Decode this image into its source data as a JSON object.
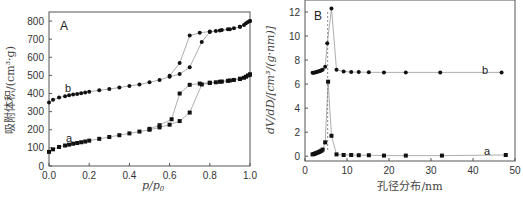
{
  "chart_data": [
    {
      "type": "scatter",
      "panel_label": "A",
      "title": "",
      "xlabel": "p/p0",
      "ylabel": "吸附体积/(cm³·g)",
      "xlim": [
        0,
        1.0
      ],
      "ylim": [
        0,
        850
      ],
      "xticks": [
        "0.0",
        "0.2",
        "0.4",
        "0.6",
        "0.8",
        "1.0"
      ],
      "yticks": [
        "0",
        "100",
        "200",
        "300",
        "400",
        "500",
        "600",
        "700",
        "800"
      ],
      "grid": false,
      "series": [
        {
          "name": "a",
          "marker": "square",
          "adsorption": {
            "x": [
              0.0,
              0.02,
              0.05,
              0.08,
              0.1,
              0.12,
              0.14,
              0.16,
              0.18,
              0.2,
              0.25,
              0.3,
              0.35,
              0.4,
              0.45,
              0.5,
              0.55,
              0.6,
              0.65,
              0.7,
              0.76,
              0.8,
              0.83,
              0.86,
              0.89,
              0.92,
              0.95,
              0.97,
              0.98,
              0.99,
              1.0
            ],
            "y": [
              78,
              92,
              105,
              113,
              118,
              123,
              127,
              131,
              135,
              140,
              150,
              160,
              170,
              180,
              190,
              200,
              213,
              228,
              248,
              295,
              450,
              458,
              462,
              466,
              470,
              475,
              480,
              487,
              493,
              500,
              505
            ]
          },
          "desorption": {
            "x": [
              1.0,
              0.95,
              0.9,
              0.85,
              0.8,
              0.75,
              0.7,
              0.65,
              0.61,
              0.55,
              0.5
            ],
            "y": [
              505,
              482,
              472,
              465,
              460,
              455,
              448,
              400,
              258,
              225,
              205
            ]
          }
        },
        {
          "name": "b",
          "marker": "circle",
          "adsorption": {
            "x": [
              0.0,
              0.02,
              0.05,
              0.08,
              0.1,
              0.12,
              0.14,
              0.16,
              0.18,
              0.2,
              0.25,
              0.3,
              0.35,
              0.4,
              0.45,
              0.5,
              0.55,
              0.6,
              0.65,
              0.7,
              0.76,
              0.8,
              0.83,
              0.86,
              0.89,
              0.92,
              0.95,
              0.97,
              0.98,
              0.99,
              1.0
            ],
            "y": [
              350,
              365,
              378,
              385,
              390,
              395,
              398,
              402,
              405,
              410,
              418,
              425,
              433,
              442,
              450,
              462,
              475,
              492,
              508,
              545,
              685,
              740,
              745,
              750,
              755,
              760,
              768,
              778,
              788,
              795,
              800
            ]
          },
          "desorption": {
            "x": [
              1.0,
              0.95,
              0.9,
              0.85,
              0.8,
              0.75,
              0.7,
              0.65,
              0.6
            ],
            "y": [
              800,
              768,
              755,
              748,
              742,
              735,
              720,
              568,
              498
            ]
          }
        }
      ],
      "annotations": [
        {
          "text": "a",
          "x": 0.1,
          "y": 160
        },
        {
          "text": "b",
          "x": 0.09,
          "y": 430
        }
      ]
    },
    {
      "type": "line",
      "panel_label": "B",
      "title": "",
      "xlabel": "孔径分布/nm",
      "ylabel": "dV/dD/[cm³/(g·nm)]",
      "xlim": [
        0,
        50
      ],
      "ylim": [
        -0.4,
        13
      ],
      "xticks": [
        "0",
        "10",
        "20",
        "30",
        "40",
        "50"
      ],
      "yticks": [
        "0",
        "2",
        "4",
        "6",
        "8",
        "10",
        "12"
      ],
      "grid": false,
      "series": [
        {
          "name": "a",
          "marker": "square",
          "x": [
            1.8,
            2.1,
            2.4,
            2.7,
            3.0,
            3.3,
            3.6,
            3.9,
            4.2,
            4.8,
            5.5,
            6.3,
            7.5,
            9.2,
            11.0,
            12.8,
            15.2,
            18.8,
            24.0,
            32.6,
            47.8
          ],
          "y": [
            0.15,
            0.18,
            0.22,
            0.26,
            0.3,
            0.35,
            0.4,
            0.45,
            0.55,
            1.15,
            6.2,
            1.7,
            0.15,
            0.1,
            0.1,
            0.08,
            0.08,
            0.05,
            0.05,
            0.05,
            0.1
          ]
        },
        {
          "name": "b",
          "marker": "circle",
          "x": [
            1.8,
            2.1,
            2.4,
            2.7,
            3.0,
            3.3,
            3.6,
            3.9,
            4.2,
            4.8,
            5.3,
            6.3,
            7.5,
            9.2,
            11.0,
            12.8,
            15.2,
            18.8,
            24.0,
            32.2,
            46.8
          ],
          "y": [
            6.95,
            6.95,
            6.97,
            7.0,
            7.03,
            7.07,
            7.1,
            7.15,
            7.2,
            7.45,
            9.4,
            12.3,
            7.2,
            7.05,
            7.0,
            7.0,
            6.98,
            6.97,
            6.97,
            6.97,
            6.97
          ]
        }
      ],
      "annotations": [
        {
          "text": "a",
          "x": 43,
          "y": 0.45
        },
        {
          "text": "b",
          "x": 42,
          "y": 7.4
        }
      ]
    }
  ]
}
